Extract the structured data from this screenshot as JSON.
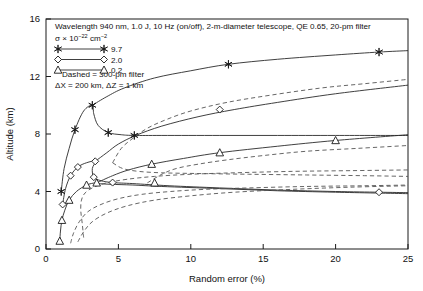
{
  "chart_data": {
    "type": "line",
    "title": "",
    "xlabel": "Random error (%)",
    "ylabel": "Altitude (km)",
    "xlim": [
      0,
      25
    ],
    "ylim": [
      0,
      16
    ],
    "xticks": [
      0,
      5,
      10,
      15,
      20,
      25
    ],
    "yticks": [
      0,
      4,
      8,
      12,
      16
    ],
    "grid": false,
    "annotations": {
      "line1": "Wavelength 940 nm, 1.0 J, 10 Hz (on/off), 2-m-diameter telescope, QE 0.65, 20-pm filter",
      "line2_pre": "σ × 10",
      "line2_sup1": "−22",
      "line2_mid": " cm",
      "line2_sup2": "−2",
      "line3": "Dashed = 300-pm filter",
      "line4": "ΔX = 200 km, ΔZ = 1 km"
    },
    "legend": {
      "position": "top-left",
      "entries": [
        {
          "label": "9.7",
          "marker": "star"
        },
        {
          "label": "2.0",
          "marker": "diamond"
        },
        {
          "label": "0.2",
          "marker": "triangle"
        }
      ]
    },
    "series": [
      {
        "name": "9.7 solid (20-pm filter)",
        "marker": "star",
        "style": "solid",
        "points": [
          [
            1.05,
            4.0
          ],
          [
            1.25,
            5.6
          ],
          [
            1.6,
            7.0
          ],
          [
            2.0,
            8.3
          ],
          [
            2.6,
            9.6
          ],
          [
            3.2,
            10.0
          ],
          [
            3.3,
            9.4
          ],
          [
            3.6,
            8.6
          ],
          [
            4.3,
            8.1
          ],
          [
            5.2,
            7.95
          ],
          [
            6.1,
            7.9
          ],
          [
            8.0,
            7.9
          ],
          [
            12.0,
            7.9
          ],
          [
            16.0,
            7.9
          ],
          [
            20.0,
            7.9
          ],
          [
            25.0,
            7.9
          ]
        ]
      },
      {
        "name": "9.7 solid upper branch",
        "marker": "star",
        "style": "solid",
        "points": [
          [
            3.2,
            10.0
          ],
          [
            4.2,
            10.6
          ],
          [
            5.4,
            11.2
          ],
          [
            7.5,
            11.9
          ],
          [
            10.0,
            12.4
          ],
          [
            12.6,
            12.85
          ],
          [
            16.0,
            13.2
          ],
          [
            20.0,
            13.5
          ],
          [
            23.0,
            13.7
          ],
          [
            25.0,
            13.8
          ]
        ]
      },
      {
        "name": "2.0 solid lower branch",
        "marker": "diamond",
        "style": "solid",
        "points": [
          [
            1.15,
            3.1
          ],
          [
            1.35,
            4.2
          ],
          [
            1.7,
            5.1
          ],
          [
            2.2,
            5.7
          ],
          [
            2.8,
            6.0
          ],
          [
            3.4,
            6.1
          ],
          [
            3.2,
            5.6
          ],
          [
            3.3,
            5.0
          ],
          [
            3.8,
            4.75
          ],
          [
            4.6,
            4.62
          ],
          [
            6.0,
            4.55
          ],
          [
            8.5,
            4.4
          ],
          [
            12.0,
            4.25
          ],
          [
            16.0,
            4.1
          ],
          [
            20.0,
            4.0
          ],
          [
            23.0,
            3.95
          ],
          [
            25.0,
            3.92
          ]
        ]
      },
      {
        "name": "2.0 solid upper branch",
        "marker": "diamond",
        "style": "solid",
        "points": [
          [
            3.4,
            6.1
          ],
          [
            4.2,
            6.7
          ],
          [
            5.0,
            7.3
          ],
          [
            6.2,
            7.9
          ],
          [
            8.0,
            8.55
          ],
          [
            10.5,
            9.2
          ],
          [
            13.0,
            9.7
          ],
          [
            16.0,
            10.2
          ],
          [
            20.0,
            10.8
          ],
          [
            25.0,
            11.4
          ]
        ]
      },
      {
        "name": "0.2 solid lower branch",
        "marker": "triangle",
        "style": "solid",
        "points": [
          [
            0.95,
            0.55
          ],
          [
            1.0,
            1.25
          ],
          [
            1.1,
            2.0
          ],
          [
            1.3,
            2.7
          ],
          [
            1.6,
            3.4
          ],
          [
            2.1,
            4.0
          ],
          [
            2.8,
            4.45
          ],
          [
            3.4,
            4.6
          ],
          [
            3.6,
            4.55
          ],
          [
            4.5,
            4.5
          ],
          [
            6.0,
            4.45
          ],
          [
            8.0,
            4.35
          ],
          [
            12.0,
            4.2
          ],
          [
            16.0,
            4.05
          ],
          [
            20.0,
            3.95
          ],
          [
            25.0,
            3.85
          ]
        ]
      },
      {
        "name": "0.2 solid upper branch",
        "marker": "triangle",
        "style": "solid",
        "points": [
          [
            3.5,
            4.6
          ],
          [
            4.6,
            5.1
          ],
          [
            5.7,
            5.5
          ],
          [
            7.3,
            5.9
          ],
          [
            9.5,
            6.3
          ],
          [
            12.0,
            6.7
          ],
          [
            16.0,
            7.15
          ],
          [
            20.0,
            7.55
          ],
          [
            25.0,
            7.95
          ]
        ]
      },
      {
        "name": "9.7 dashed (300-pm filter)",
        "marker": "none",
        "style": "dashed",
        "points": [
          [
            4.6,
            6.0
          ],
          [
            5.2,
            7.0
          ],
          [
            6.0,
            7.7
          ],
          [
            7.0,
            8.4
          ],
          [
            8.3,
            9.0
          ],
          [
            10.0,
            9.6
          ],
          [
            12.5,
            10.2
          ],
          [
            15.5,
            10.7
          ],
          [
            19.0,
            11.2
          ],
          [
            22.0,
            11.5
          ],
          [
            25.0,
            11.8
          ]
        ]
      },
      {
        "name": "9.7 dashed lower branch",
        "marker": "none",
        "style": "dashed",
        "points": [
          [
            4.6,
            6.0
          ],
          [
            5.3,
            5.6
          ],
          [
            6.4,
            5.4
          ],
          [
            8.0,
            5.3
          ],
          [
            10.5,
            5.25
          ],
          [
            14.0,
            5.2
          ],
          [
            18.0,
            5.15
          ],
          [
            22.0,
            5.1
          ],
          [
            25.0,
            5.05
          ]
        ]
      },
      {
        "name": "2.0 dashed upper branch",
        "marker": "none",
        "style": "dashed",
        "points": [
          [
            2.6,
            0.8
          ],
          [
            2.5,
            1.8
          ],
          [
            2.4,
            2.7
          ],
          [
            2.45,
            3.4
          ],
          [
            2.7,
            3.9
          ],
          [
            3.3,
            4.3
          ],
          [
            4.2,
            4.6
          ],
          [
            5.6,
            4.85
          ],
          [
            7.5,
            5.05
          ],
          [
            10.0,
            5.2
          ],
          [
            13.0,
            5.3
          ],
          [
            17.0,
            5.4
          ],
          [
            21.0,
            5.45
          ],
          [
            25.0,
            5.5
          ]
        ]
      },
      {
        "name": "2.0 dashed lower branch",
        "marker": "none",
        "style": "dashed",
        "points": [
          [
            2.2,
            0.5
          ],
          [
            2.6,
            1.2
          ],
          [
            3.2,
            1.9
          ],
          [
            4.2,
            2.5
          ],
          [
            5.6,
            3.0
          ],
          [
            7.5,
            3.4
          ],
          [
            10.0,
            3.7
          ],
          [
            13.0,
            3.95
          ],
          [
            17.0,
            4.15
          ],
          [
            21.0,
            4.3
          ],
          [
            25.0,
            4.4
          ]
        ]
      },
      {
        "name": "0.2 dashed branch",
        "marker": "none",
        "style": "dashed",
        "points": [
          [
            1.7,
            0.4
          ],
          [
            1.9,
            1.1
          ],
          [
            2.3,
            1.9
          ],
          [
            2.9,
            2.6
          ],
          [
            3.8,
            3.1
          ],
          [
            5.0,
            3.5
          ],
          [
            6.6,
            3.8
          ],
          [
            8.6,
            4.0
          ],
          [
            11.0,
            4.15
          ],
          [
            14.0,
            4.25
          ],
          [
            18.0,
            4.35
          ],
          [
            22.0,
            4.4
          ],
          [
            25.0,
            4.45
          ]
        ]
      },
      {
        "name": "0.2 dashed upper branch",
        "marker": "none",
        "style": "dashed",
        "points": [
          [
            7.0,
            4.6
          ],
          [
            8.0,
            5.2
          ],
          [
            9.0,
            5.6
          ],
          [
            10.5,
            5.9
          ],
          [
            12.5,
            6.2
          ],
          [
            15.0,
            6.5
          ],
          [
            18.0,
            6.8
          ],
          [
            21.5,
            7.0
          ],
          [
            25.0,
            7.2
          ]
        ]
      }
    ],
    "markers": {
      "star": [
        [
          1.05,
          4.0
        ],
        [
          2.0,
          8.3
        ],
        [
          3.2,
          10.0
        ],
        [
          4.3,
          8.1
        ],
        [
          6.1,
          7.9
        ],
        [
          12.6,
          12.85
        ],
        [
          23.0,
          13.7
        ]
      ],
      "diamond": [
        [
          1.15,
          3.1
        ],
        [
          1.7,
          5.1
        ],
        [
          2.2,
          5.7
        ],
        [
          3.4,
          6.1
        ],
        [
          3.3,
          5.0
        ],
        [
          4.6,
          4.62
        ],
        [
          12.0,
          9.7
        ],
        [
          23.0,
          3.95
        ]
      ],
      "triangle": [
        [
          0.95,
          0.55
        ],
        [
          1.1,
          2.0
        ],
        [
          1.6,
          3.4
        ],
        [
          2.8,
          4.45
        ],
        [
          3.5,
          4.6
        ],
        [
          7.3,
          5.9
        ],
        [
          12.0,
          6.7
        ],
        [
          20.0,
          7.55
        ],
        [
          7.5,
          4.6
        ]
      ]
    }
  }
}
